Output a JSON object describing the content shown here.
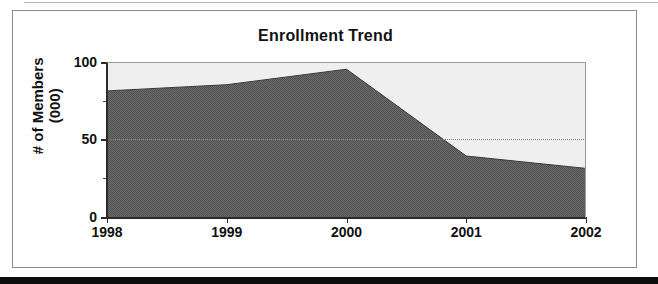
{
  "figure": {
    "title": "Enrollment Trend"
  },
  "chart_data": {
    "type": "area",
    "title": "Enrollment Trend",
    "xlabel": "",
    "ylabel": "# of Members (000)",
    "ylabel_lines": [
      "# of Members",
      "(000)"
    ],
    "categories": [
      "1998",
      "1999",
      "2000",
      "2001",
      "2002"
    ],
    "x": [
      1998,
      1999,
      2000,
      2001,
      2002
    ],
    "values": [
      82,
      86,
      96,
      40,
      32
    ],
    "series": [
      {
        "name": "Enrollment",
        "values": [
          82,
          86,
          96,
          40,
          32
        ]
      }
    ],
    "ylim": [
      0,
      100
    ],
    "ytick_labels": [
      "0",
      "50",
      "100"
    ],
    "yticks": [
      0,
      50,
      100
    ],
    "xtick_labels": [
      "1998",
      "1999",
      "2000",
      "2001",
      "2002"
    ],
    "grid": "dotted horizontal gridline at 50",
    "legend": "none",
    "legend_position": "none",
    "colors": {
      "area_fill": "#6e6e6e",
      "plot_background": "#efefef",
      "axis": "#2b2b2b",
      "text": "#111111",
      "gridline": "#7d7d7d"
    }
  }
}
